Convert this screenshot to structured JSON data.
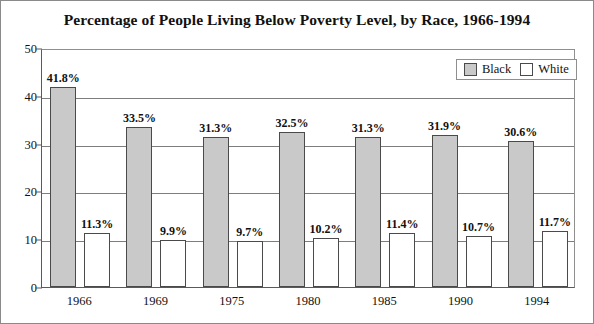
{
  "chart_data": {
    "type": "bar",
    "title": "Percentage of People Living Below Poverty Level, by Race, 1966-1994",
    "xlabel": "",
    "ylabel": "",
    "categories": [
      "1966",
      "1969",
      "1975",
      "1980",
      "1985",
      "1990",
      "1994"
    ],
    "series": [
      {
        "name": "Black",
        "color": "#c9c9c9",
        "values": [
          41.8,
          33.5,
          31.3,
          32.5,
          31.3,
          31.9,
          30.6
        ],
        "labels": [
          "41.8%",
          "33.5%",
          "31.3%",
          "32.5%",
          "31.3%",
          "31.9%",
          "30.6%"
        ]
      },
      {
        "name": "White",
        "color": "#ffffff",
        "values": [
          11.3,
          9.9,
          9.7,
          10.2,
          11.4,
          10.7,
          11.7
        ],
        "labels": [
          "11.3%",
          "9.9%",
          "9.7%",
          "10.2%",
          "11.4%",
          "10.7%",
          "11.7%"
        ]
      }
    ],
    "ylim": [
      0,
      50
    ],
    "yticks": [
      0,
      10,
      20,
      30,
      40,
      50
    ],
    "ytick_labels": [
      "0",
      "10",
      "20",
      "30",
      "40",
      "50"
    ],
    "grid": true,
    "legend_position": "top-right",
    "legend_entries": [
      "Black",
      "White"
    ]
  }
}
